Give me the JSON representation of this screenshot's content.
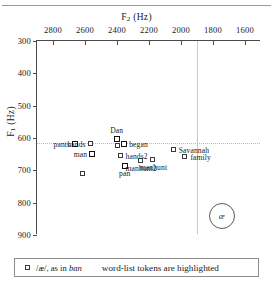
{
  "figure": {
    "x_axis_title": "F2 (Hz)",
    "x_axis_title_main": "F",
    "x_axis_title_sub": "2",
    "x_axis_title_unit": " (Hz)",
    "y_axis_title_main": "F",
    "y_axis_title_sub": "1",
    "y_axis_title_unit": " (Hz)"
  },
  "legend": {
    "marker": "open-square-marker",
    "vowel_text": "/æ/, as in ",
    "vowel_example": "ban",
    "note": "word-list tokens are highlighted"
  },
  "annotation": {
    "vowel_symbol": "æ"
  },
  "chart_data": {
    "type": "scatter",
    "title": "",
    "xlabel": "F2 (Hz)",
    "ylabel": "F1 (Hz)",
    "xlim": [
      2900,
      1500
    ],
    "ylim": [
      900,
      300
    ],
    "x_reversed": true,
    "y_reversed": true,
    "xticks": [
      2800,
      2600,
      2400,
      2200,
      2000,
      1800,
      1600
    ],
    "yticks": [
      300,
      400,
      500,
      600,
      700,
      800,
      900
    ],
    "grid": false,
    "reference_lines": {
      "horizontal_f1": 617,
      "vertical_f2": 1900
    },
    "legend_position": "below-plot",
    "points": [
      {
        "label": "pants",
        "x": 2662,
        "y": 618,
        "highlighted": true,
        "label_pos": "l"
      },
      {
        "label": "hands",
        "x": 2565,
        "y": 618,
        "highlighted": false,
        "label_pos": "l"
      },
      {
        "label": "man",
        "x": 2555,
        "y": 648,
        "highlighted": true,
        "label_pos": "l"
      },
      {
        "label": "Dan",
        "x": 2402,
        "y": 602,
        "highlighted": true,
        "label_pos": "t"
      },
      {
        "label": "",
        "x": 2392,
        "y": 625,
        "highlighted": false,
        "label_pos": "r"
      },
      {
        "label": "began",
        "x": 2355,
        "y": 618,
        "highlighted": true,
        "label_pos": "r"
      },
      {
        "label": "hands2",
        "x": 2378,
        "y": 655,
        "highlighted": false,
        "label_pos": "r"
      },
      {
        "label": "pan",
        "x": 2352,
        "y": 688,
        "highlighted": true,
        "label_pos": "b"
      },
      {
        "label": "manhunt2",
        "x": 2250,
        "y": 672,
        "highlighted": false,
        "label_pos": "b"
      },
      {
        "label": "manhunt",
        "x": 2172,
        "y": 668,
        "highlighted": false,
        "label_pos": "b"
      },
      {
        "label": "Savannah",
        "x": 2045,
        "y": 638,
        "highlighted": false,
        "label_pos": "r"
      },
      {
        "label": "family",
        "x": 1972,
        "y": 658,
        "highlighted": false,
        "label_pos": "r"
      },
      {
        "label": "",
        "x": 2610,
        "y": 710,
        "highlighted": false,
        "label_pos": "r"
      }
    ],
    "annotation_circle": {
      "x": 1752,
      "y": 838,
      "text": "æ"
    }
  }
}
